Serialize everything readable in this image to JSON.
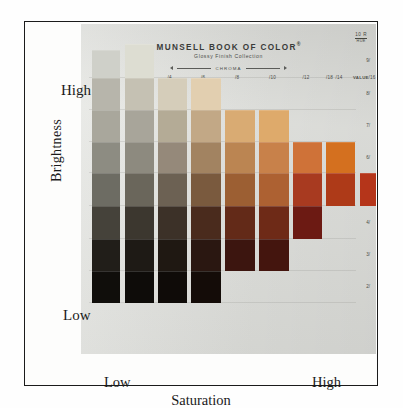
{
  "figure": {
    "title": "MUNSELL BOOK OF COLOR",
    "registered_mark": "®",
    "subtitle": "Glossy Finish Collection",
    "chroma_axis_label": "CHROMA",
    "hue_notation": {
      "value": "10 R",
      "word": "HUE"
    }
  },
  "axes": {
    "y_label": "Brightness",
    "y_high": "High",
    "y_low": "Low",
    "x_label": "Saturation",
    "x_low": "Low",
    "x_high": "High"
  },
  "chart_data": {
    "type": "heatmap",
    "subtitle": "10 R hue page: Munsell Value (brightness) vs Munsell Chroma (saturation)",
    "xlabel": "Saturation",
    "ylabel": "Brightness",
    "grid": true,
    "legend": "none",
    "x_tick_labels": [
      "/2",
      "/3",
      "/4",
      "/6",
      "/8",
      "/10",
      "/12",
      "/14",
      "/16",
      "/18",
      "VALUE"
    ],
    "x_chroma_values": [
      2,
      3,
      4,
      6,
      8,
      10,
      12,
      14,
      16,
      18
    ],
    "y_tick_labels": [
      "9/",
      "8/",
      "7/",
      "6/",
      "5/",
      "4/",
      "3/",
      "2/"
    ],
    "y_value_levels": [
      9,
      8,
      7,
      6,
      5,
      4,
      3,
      2
    ],
    "columns": [
      {
        "chroma": "/2",
        "x": 11,
        "w": 28,
        "cells": [
          {
            "value": "9/",
            "y": 26,
            "h": 28,
            "color": "#cfd0c9"
          },
          {
            "value": "8/",
            "y": 54,
            "h": 32,
            "color": "#b7b5ab"
          },
          {
            "value": "7/",
            "y": 86,
            "h": 32,
            "color": "#a9a79c"
          },
          {
            "value": "6/",
            "y": 118,
            "h": 31,
            "color": "#8d8c82"
          },
          {
            "value": "5/",
            "y": 149,
            "h": 33,
            "color": "#6d6c63"
          },
          {
            "value": "4/",
            "y": 182,
            "h": 33,
            "color": "#45423a"
          },
          {
            "value": "3/",
            "y": 215,
            "h": 32,
            "color": "#211e19"
          },
          {
            "value": "2/",
            "y": 247,
            "h": 32,
            "color": "#100e0b"
          }
        ]
      },
      {
        "chroma": "/3",
        "x": 44,
        "w": 29,
        "cells": [
          {
            "value": "9/",
            "y": 20,
            "h": 34,
            "color": "#ddddd2"
          },
          {
            "value": "8/",
            "y": 54,
            "h": 32,
            "color": "#c5c1b3"
          },
          {
            "value": "7/",
            "y": 86,
            "h": 32,
            "color": "#a8a59a"
          },
          {
            "value": "6/",
            "y": 118,
            "h": 31,
            "color": "#8d8a7f"
          },
          {
            "value": "5/",
            "y": 149,
            "h": 33,
            "color": "#6a665b"
          },
          {
            "value": "4/",
            "y": 182,
            "h": 33,
            "color": "#3c372f"
          },
          {
            "value": "3/",
            "y": 215,
            "h": 32,
            "color": "#1e1a15"
          },
          {
            "value": "2/",
            "y": 247,
            "h": 32,
            "color": "#0e0c09"
          }
        ]
      },
      {
        "chroma": "/4",
        "x": 77,
        "w": 29,
        "cells": [
          {
            "value": "8/",
            "y": 54,
            "h": 32,
            "color": "#d5cdba"
          },
          {
            "value": "7/",
            "y": 86,
            "h": 32,
            "color": "#b4ab96"
          },
          {
            "value": "6/",
            "y": 118,
            "h": 31,
            "color": "#95897a"
          },
          {
            "value": "5/",
            "y": 149,
            "h": 33,
            "color": "#6c6153"
          },
          {
            "value": "4/",
            "y": 182,
            "h": 33,
            "color": "#3c3128"
          },
          {
            "value": "3/",
            "y": 215,
            "h": 32,
            "color": "#1f1812"
          },
          {
            "value": "2/",
            "y": 247,
            "h": 32,
            "color": "#0f0b08"
          }
        ]
      },
      {
        "chroma": "/6",
        "x": 110,
        "w": 30,
        "cells": [
          {
            "value": "8/",
            "y": 54,
            "h": 32,
            "color": "#e2cfb0"
          },
          {
            "value": "7/",
            "y": 86,
            "h": 32,
            "color": "#c2a886"
          },
          {
            "value": "6/",
            "y": 118,
            "h": 31,
            "color": "#a28361"
          },
          {
            "value": "5/",
            "y": 149,
            "h": 33,
            "color": "#7a5a3e"
          },
          {
            "value": "4/",
            "y": 182,
            "h": 33,
            "color": "#4a2b1d"
          },
          {
            "value": "3/",
            "y": 215,
            "h": 32,
            "color": "#2a1711"
          },
          {
            "value": "2/",
            "y": 247,
            "h": 32,
            "color": "#140c08"
          }
        ]
      },
      {
        "chroma": "/8",
        "x": 144,
        "w": 30,
        "cells": [
          {
            "value": "7/",
            "y": 86,
            "h": 32,
            "color": "#d9ab73"
          },
          {
            "value": "6/",
            "y": 118,
            "h": 31,
            "color": "#bb8552"
          },
          {
            "value": "5/",
            "y": 149,
            "h": 33,
            "color": "#9c5f33"
          },
          {
            "value": "4/",
            "y": 182,
            "h": 33,
            "color": "#632a18"
          },
          {
            "value": "3/",
            "y": 215,
            "h": 32,
            "color": "#3c150f"
          }
        ]
      },
      {
        "chroma": "/10",
        "x": 178,
        "w": 30,
        "cells": [
          {
            "value": "7/",
            "y": 86,
            "h": 32,
            "color": "#deaa6b"
          },
          {
            "value": "6/",
            "y": 118,
            "h": 31,
            "color": "#c8814a"
          },
          {
            "value": "5/",
            "y": 149,
            "h": 33,
            "color": "#ad6132"
          },
          {
            "value": "4/",
            "y": 182,
            "h": 33,
            "color": "#6e2a17"
          },
          {
            "value": "3/",
            "y": 215,
            "h": 32,
            "color": "#44150e"
          }
        ]
      },
      {
        "chroma": "/12",
        "x": 212,
        "w": 29,
        "cells": [
          {
            "value": "6/",
            "y": 118,
            "h": 31,
            "color": "#cf7238"
          },
          {
            "value": "5/",
            "y": 149,
            "h": 33,
            "color": "#a83a20"
          },
          {
            "value": "4/",
            "y": 182,
            "h": 33,
            "color": "#6c1a13"
          }
        ]
      },
      {
        "chroma": "/14",
        "x": 245,
        "w": 29,
        "cells": [
          {
            "value": "6/",
            "y": 118,
            "h": 31,
            "color": "#d4701f"
          },
          {
            "value": "5/",
            "y": 149,
            "h": 33,
            "color": "#ae3a18"
          }
        ]
      },
      {
        "chroma": "/16",
        "x": 279,
        "w": 27,
        "cells": [
          {
            "value": "5/",
            "y": 149,
            "h": 33,
            "color": "#b5351a"
          }
        ]
      }
    ]
  }
}
